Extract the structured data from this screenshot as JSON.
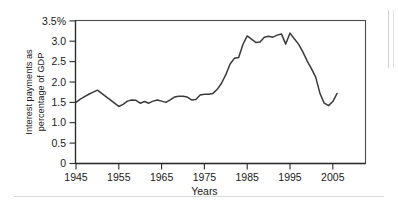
{
  "figure": {
    "name": "interest-payments-gdp-line-chart"
  },
  "chart_data": {
    "type": "line",
    "title": "",
    "xlabel": "Years",
    "ylabel": "Interest payments as percentage of GDP",
    "ylabel_line1": "Interest payments as",
    "ylabel_line2": "percentage of GDP",
    "xlim": [
      1945,
      2007
    ],
    "ylim": [
      0,
      3.5
    ],
    "grid": false,
    "legend": null,
    "line_color": "#3a3a3a",
    "yticks": [
      0,
      0.5,
      1.0,
      1.5,
      2.0,
      2.5,
      3.0,
      3.5
    ],
    "ytick_labels": [
      "0",
      "0.5",
      "1.0",
      "1.5",
      "2.0",
      "2.5",
      "3.0",
      "3.5%"
    ],
    "xticks": [
      1945,
      1955,
      1965,
      1975,
      1985,
      1995,
      2005
    ],
    "xtick_labels": [
      "1945",
      "1955",
      "1965",
      "1975",
      "1985",
      "1995",
      "2005"
    ],
    "x": [
      1945,
      1946,
      1947,
      1948,
      1949,
      1950,
      1951,
      1952,
      1953,
      1954,
      1955,
      1956,
      1957,
      1958,
      1959,
      1960,
      1961,
      1962,
      1963,
      1964,
      1965,
      1966,
      1967,
      1968,
      1969,
      1970,
      1971,
      1972,
      1973,
      1974,
      1975,
      1976,
      1977,
      1978,
      1979,
      1980,
      1981,
      1982,
      1983,
      1984,
      1985,
      1986,
      1987,
      1988,
      1989,
      1990,
      1991,
      1992,
      1993,
      1994,
      1995,
      1996,
      1997,
      1998,
      1999,
      2000,
      2001,
      2002,
      2003,
      2004,
      2005,
      2006
    ],
    "values": [
      1.5,
      1.58,
      1.64,
      1.7,
      1.75,
      1.8,
      1.72,
      1.64,
      1.56,
      1.48,
      1.4,
      1.45,
      1.53,
      1.56,
      1.55,
      1.48,
      1.52,
      1.48,
      1.53,
      1.56,
      1.53,
      1.5,
      1.56,
      1.63,
      1.65,
      1.65,
      1.63,
      1.56,
      1.57,
      1.68,
      1.7,
      1.7,
      1.72,
      1.82,
      1.97,
      2.18,
      2.44,
      2.58,
      2.6,
      2.92,
      3.13,
      3.05,
      2.97,
      2.98,
      3.1,
      3.12,
      3.1,
      3.15,
      3.18,
      2.93,
      3.2,
      3.06,
      2.93,
      2.74,
      2.52,
      2.33,
      2.12,
      1.72,
      1.48,
      1.42,
      1.52,
      1.72
    ]
  }
}
